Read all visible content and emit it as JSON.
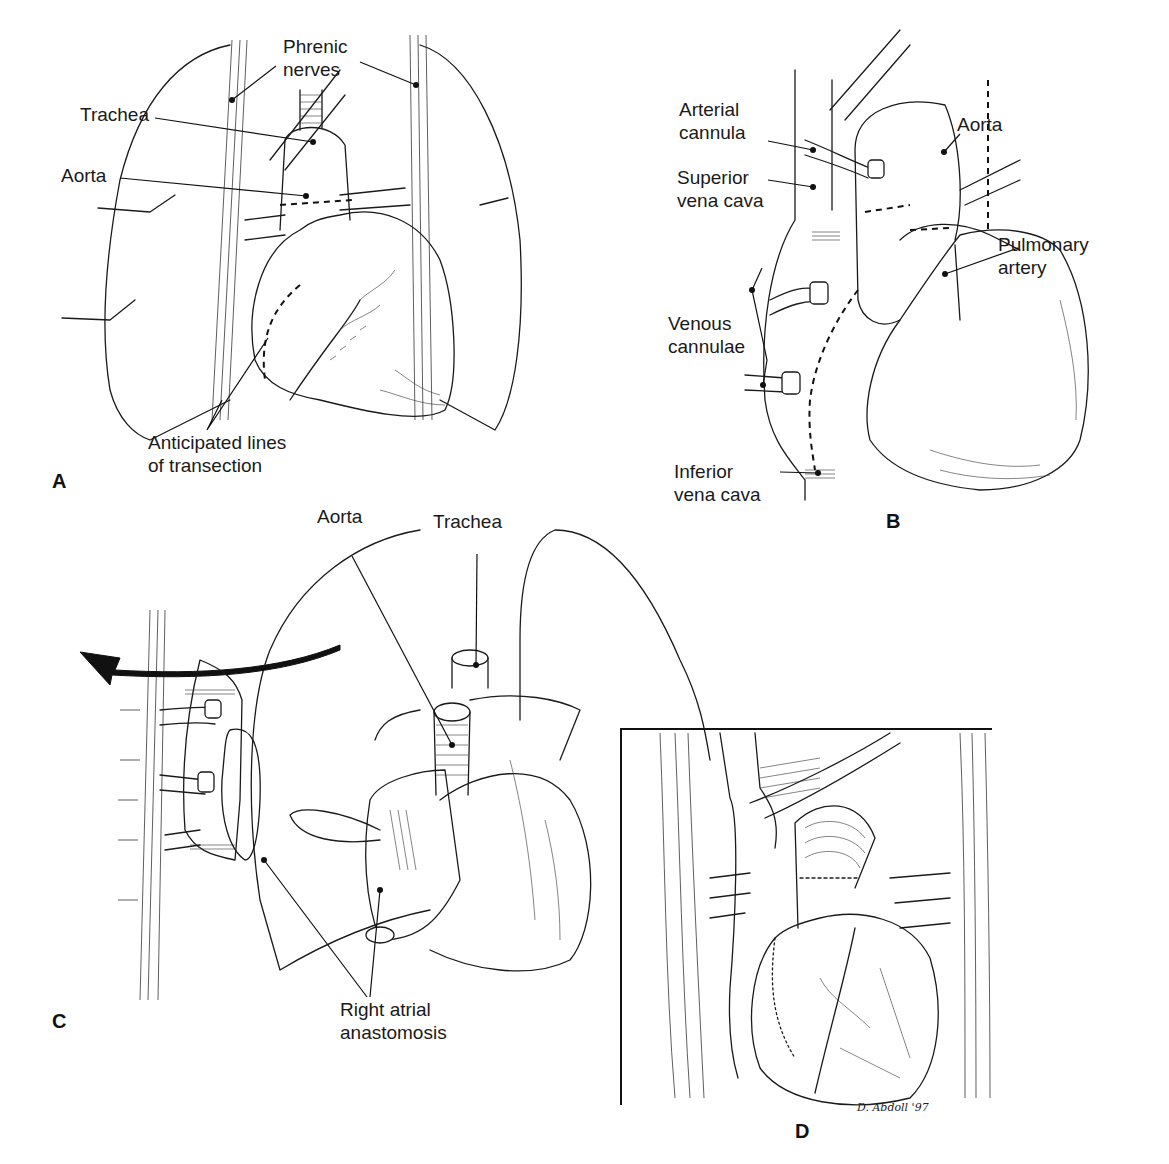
{
  "figure": {
    "panels": [
      {
        "id": "A",
        "letter": "A",
        "labels": {
          "phrenic_nerves": "Phrenic\nnerves",
          "trachea": "Trachea",
          "aorta": "Aorta",
          "anticipated_lines": "Anticipated lines\nof transection"
        }
      },
      {
        "id": "B",
        "letter": "B",
        "labels": {
          "arterial_cannula": "Arterial\ncannula",
          "superior_vena_cava": "Superior\nvena cava",
          "aorta": "Aorta",
          "pulmonary_artery": "Pulmonary\nartery",
          "venous_cannulae": "Venous\ncannulae",
          "inferior_vena_cava": "Inferior\nvena cava"
        }
      },
      {
        "id": "C",
        "letter": "C",
        "labels": {
          "aorta": "Aorta",
          "trachea": "Trachea",
          "right_atrial_anastomosis": "Right atrial\nanastomosis"
        }
      },
      {
        "id": "D",
        "letter": "D",
        "signature": "D. Abdoll '97"
      }
    ]
  }
}
